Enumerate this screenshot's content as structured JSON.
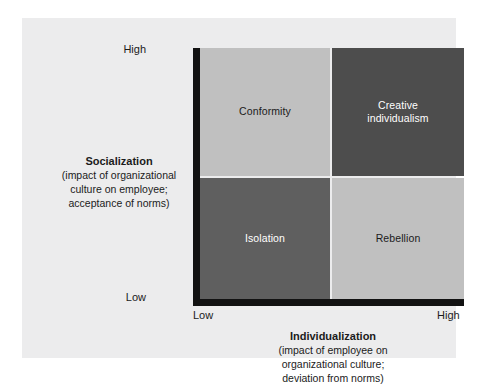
{
  "chart_data": {
    "type": "table",
    "title": "",
    "xlabel": "Individualization",
    "ylabel": "Socialization",
    "axes": {
      "y": {
        "heading": "Socialization",
        "sub_line1": "(impact of organizational",
        "sub_line2": "culture on employee;",
        "sub_line3": "acceptance of norms)",
        "high_label": "High",
        "low_label": "Low"
      },
      "x": {
        "heading": "Individualization",
        "sub_line1": "(impact of employee on",
        "sub_line2": "organizational culture;",
        "sub_line3": "deviation from norms)",
        "high_label": "High",
        "low_label": "Low"
      }
    },
    "categories": [
      "Low individualization",
      "High individualization"
    ],
    "row_categories": [
      "High socialization",
      "Low socialization"
    ],
    "quadrants": [
      {
        "id": "top-left",
        "label": "Conformity",
        "socialization": "High",
        "individualization": "Low",
        "fill": "#c0c0c0",
        "text_color": "#1b1b1b"
      },
      {
        "id": "top-right",
        "label_line1": "Creative",
        "label_line2": "individualism",
        "label": "Creative individualism",
        "socialization": "High",
        "individualization": "High",
        "fill": "#4d4d4d",
        "text_color": "#ffffff"
      },
      {
        "id": "bottom-left",
        "label": "Isolation",
        "socialization": "Low",
        "individualization": "Low",
        "fill": "#5f5f5f",
        "text_color": "#ffffff"
      },
      {
        "id": "bottom-right",
        "label": "Rebellion",
        "socialization": "Low",
        "individualization": "High",
        "fill": "#c0c0c0",
        "text_color": "#1b1b1b"
      }
    ],
    "colors": {
      "page_background": "#ffffff",
      "panel_background": "#ececed",
      "axis": "#121212",
      "quadrant_light": "#c0c0c0",
      "quadrant_medium": "#5f5f5f",
      "quadrant_dark": "#4d4d4d",
      "gap": "#ececed"
    },
    "grid": false,
    "legend": null
  }
}
